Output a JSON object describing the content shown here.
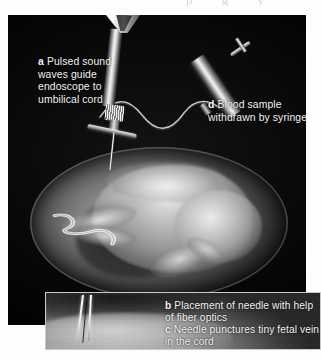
{
  "figure": {
    "page_top_fragment": "p g y",
    "background_color": "#fdfdfb",
    "panel_color": "#010101",
    "caption_color": "#f2f2f2"
  },
  "callouts": {
    "a": {
      "marker": "a",
      "text": "Pulsed sound waves guide endoscope to umbilical cord"
    },
    "d": {
      "marker": "d",
      "text": "Blood sample withdrawn by syringe"
    },
    "b": {
      "marker": "b",
      "text": "Placement of needle with help of fiber optics"
    },
    "c": {
      "marker": "c",
      "text": "Needle punctures tiny fetal vein in the cord"
    }
  },
  "illustration": {
    "endoscope_label": "endoscope-instrument",
    "syringe_label": "syringe-instrument",
    "tube_label": "connecting-tube",
    "fetus_label": "fetus-in-amniotic-sac",
    "needle_label": "needle"
  },
  "inset": {
    "label": "ultrasound-inset-image",
    "border_color": "#c9c9c9"
  }
}
